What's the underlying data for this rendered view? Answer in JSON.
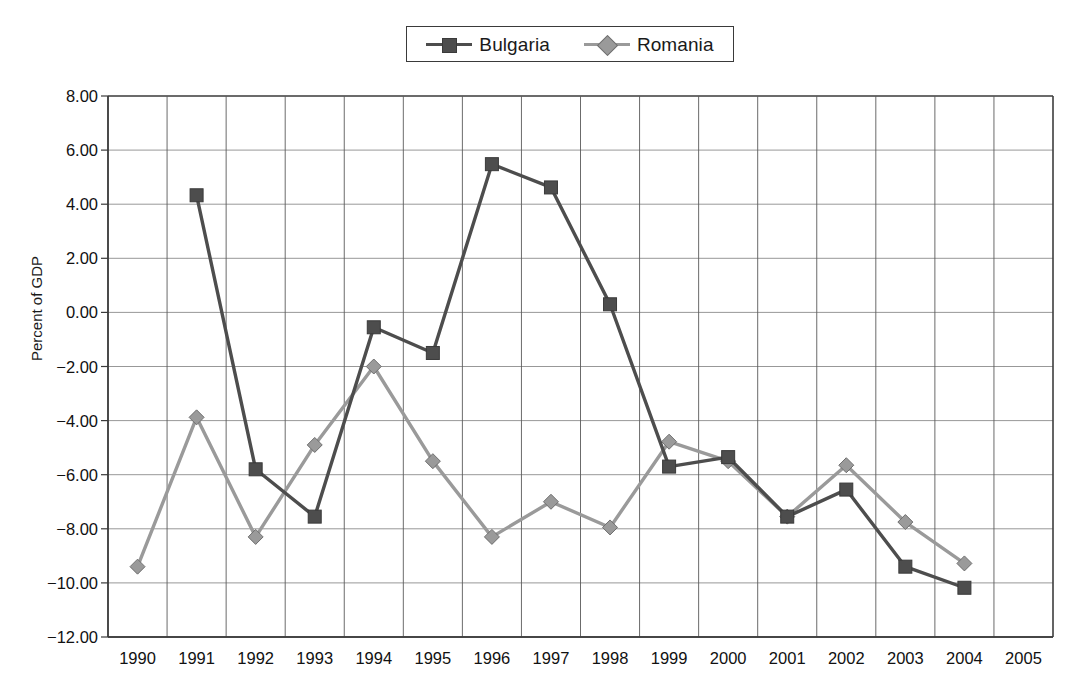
{
  "chart_data": {
    "type": "line",
    "title": "",
    "xlabel": "",
    "ylabel": "Percent of GDP",
    "x": [
      1990,
      1991,
      1992,
      1993,
      1994,
      1995,
      1996,
      1997,
      1998,
      1999,
      2000,
      2001,
      2002,
      2003,
      2004,
      2005
    ],
    "categories": [
      "1990",
      "1991",
      "1992",
      "1993",
      "1994",
      "1995",
      "1996",
      "1997",
      "1998",
      "1999",
      "2000",
      "2001",
      "2002",
      "2003",
      "2004",
      "2005"
    ],
    "ylim": [
      -12.0,
      8.0
    ],
    "ytick_labels": [
      "8.00",
      "6.00",
      "4.00",
      "2.00",
      "0.00",
      "−2.00",
      "−4.00",
      "−6.00",
      "−8.00",
      "−10.00",
      "−12.00"
    ],
    "ytick_values": [
      8,
      6,
      4,
      2,
      0,
      -2,
      -4,
      -6,
      -8,
      -10,
      -12
    ],
    "ytick_step": 2.0,
    "grid": true,
    "grid_x": true,
    "grid_y": true,
    "legend_position": "top-center",
    "series": [
      {
        "name": "Bulgaria",
        "color": "#4d4d4d",
        "marker": "square",
        "x": [
          1991,
          1992,
          1993,
          1994,
          1995,
          1996,
          1997,
          1998,
          1999,
          2000,
          2001,
          2002,
          2003,
          2004
        ],
        "values": [
          4.33,
          -5.8,
          -7.55,
          -0.55,
          -1.5,
          5.48,
          4.62,
          0.3,
          -5.7,
          -5.35,
          -7.55,
          -6.55,
          -9.4,
          -10.18
        ]
      },
      {
        "name": "Romania",
        "color": "#9a9a9a",
        "marker": "diamond",
        "x": [
          1990,
          1991,
          1992,
          1993,
          1994,
          1995,
          1996,
          1997,
          1998,
          1999,
          2000,
          2001,
          2002,
          2003,
          2004
        ],
        "values": [
          -9.4,
          -3.88,
          -8.3,
          -4.9,
          -2.0,
          -5.5,
          -8.3,
          -7.0,
          -7.95,
          -4.78,
          -5.5,
          -7.55,
          -5.65,
          -7.75,
          -9.28
        ]
      }
    ]
  },
  "legend": {
    "items": [
      {
        "label": "Bulgaria"
      },
      {
        "label": "Romania"
      }
    ]
  },
  "axis": {
    "y_title": "Percent of GDP"
  }
}
